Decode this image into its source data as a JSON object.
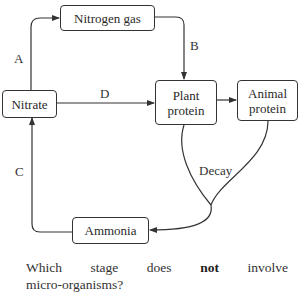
{
  "diagram": {
    "nodes": {
      "nitrogen_gas": "Nitrogen gas",
      "nitrate": "Nitrate",
      "plant_protein_line1": "Plant",
      "plant_protein_line2": "protein",
      "animal_protein_line1": "Animal",
      "animal_protein_line2": "protein",
      "ammonia": "Ammonia"
    },
    "edge_labels": {
      "a": "A",
      "b": "B",
      "c": "C",
      "d": "D",
      "decay": "Decay"
    },
    "edges": [
      {
        "label": "A",
        "from": "Nitrate",
        "to": "Nitrogen gas"
      },
      {
        "label": "B",
        "from": "Nitrogen gas",
        "to": "Plant protein"
      },
      {
        "label": "D",
        "from": "Nitrate",
        "to": "Plant protein"
      },
      {
        "label": "",
        "from": "Plant protein",
        "to": "Animal protein"
      },
      {
        "label": "Decay",
        "from": "Plant protein",
        "to": "Ammonia"
      },
      {
        "label": "Decay",
        "from": "Animal protein",
        "to": "Ammonia"
      },
      {
        "label": "C",
        "from": "Ammonia",
        "to": "Nitrate"
      }
    ],
    "line_color": "#333333"
  },
  "question": {
    "words": [
      "Which",
      "stage",
      "does",
      "not",
      "involve"
    ],
    "emphasis_word": "not",
    "line2": "micro-organisms?"
  }
}
